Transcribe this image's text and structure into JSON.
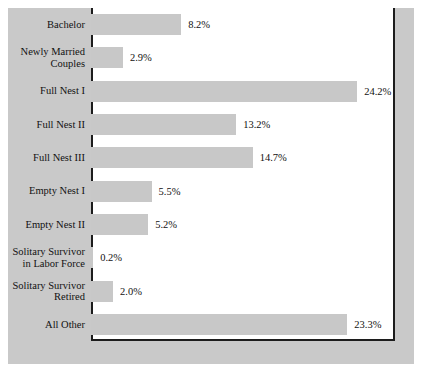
{
  "chart_data": {
    "type": "bar",
    "orientation": "horizontal",
    "title": "",
    "subtitle": "",
    "xlabel": "",
    "ylabel": "",
    "grid": false,
    "legend": null,
    "xlim": [
      0,
      27.6
    ],
    "categories": [
      "Bachelor",
      "Newly Married\nCouples",
      "Full Nest I",
      "Full Nest II",
      "Full Nest III",
      "Empty Nest I",
      "Empty Nest II",
      "Solitary Survivor\nin Labor Force",
      "Solitary Survivor\nRetired",
      "All Other"
    ],
    "values": [
      8.2,
      2.9,
      24.2,
      13.2,
      14.7,
      5.5,
      5.2,
      0.2,
      2.0,
      23.3
    ],
    "value_labels": [
      "8.2%",
      "2.9%",
      "24.2%",
      "13.2%",
      "14.7%",
      "5.5%",
      "5.2%",
      "0.2%",
      "2.0%",
      "23.3%"
    ],
    "bar_color": "#c8c8c8",
    "plot_background": "#ffffff",
    "figure_background": "#c9c9c9",
    "axis_color": "#1c1c1c",
    "text_color": "#111111",
    "px_per_percent": 11.0
  }
}
